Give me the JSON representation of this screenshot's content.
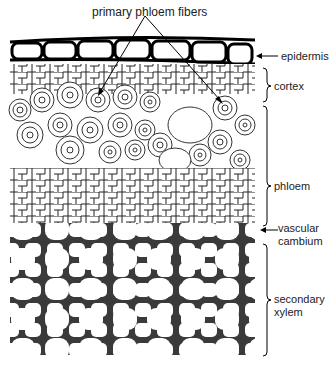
{
  "figure": {
    "title_label": "primary phloem fibers",
    "labels": {
      "epidermis": "epidermis",
      "cortex": "cortex",
      "phloem": "phloem",
      "vascular_line1": "vascular",
      "vascular_line2": "cambium",
      "xylem_line1": "secondary",
      "xylem_line2": "xylem"
    }
  }
}
